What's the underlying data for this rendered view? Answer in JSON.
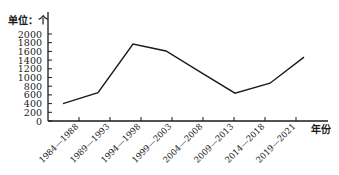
{
  "chart_data": {
    "type": "line",
    "title": "",
    "ylabel": "单位：个",
    "xlabel": "年份",
    "categories": [
      "1984—1988",
      "1989—1993",
      "1994—1998",
      "1999—2003",
      "2004—2008",
      "2009—2013",
      "2014—2018",
      "2019—2021"
    ],
    "values": [
      400,
      650,
      1770,
      1610,
      1130,
      640,
      870,
      1470
    ],
    "yticks": [
      0,
      200,
      400,
      600,
      800,
      1000,
      1200,
      1400,
      1600,
      1800,
      2000
    ],
    "ylim": [
      0,
      2000
    ],
    "grid": false,
    "legend": null,
    "line_color": "#1a1a1a"
  }
}
